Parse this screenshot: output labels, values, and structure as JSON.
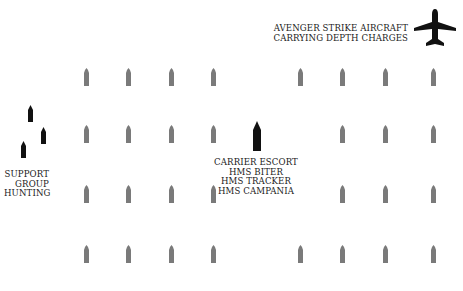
{
  "aircraft": {
    "icon": "airplane-icon",
    "label_lines": [
      "AVENGER STRIKE AIRCRAFT",
      "CARRYING DEPTH CHARGES"
    ]
  },
  "support_group": {
    "icon": "warship-icon",
    "label_lines": [
      "SUPPORT",
      "GROUP",
      "HUNTING"
    ],
    "ships": [
      {
        "x": 30,
        "y": 105
      },
      {
        "x": 43,
        "y": 127
      },
      {
        "x": 23,
        "y": 141
      }
    ]
  },
  "carrier_escort": {
    "icon": "carrier-icon",
    "label_lines": [
      "CARRIER ESCORT",
      "HMS BITER",
      "HMS TRACKER",
      "HMS CAMPANIA"
    ],
    "ship": {
      "x": 257,
      "y": 121
    }
  },
  "convoy": {
    "icon": "merchant-ship-icon",
    "color": "#7a7a7a",
    "columns_x": [
      86,
      128,
      171,
      213,
      300,
      342,
      385,
      433
    ],
    "rows_y": [
      68,
      125,
      185,
      245
    ],
    "empty_cells": [
      [
        1,
        4
      ],
      [
        2,
        4
      ]
    ]
  },
  "colors": {
    "escort": "#111111",
    "merchant": "#7a7a7a",
    "text": "#1a1a1a",
    "background": "#ffffff"
  }
}
